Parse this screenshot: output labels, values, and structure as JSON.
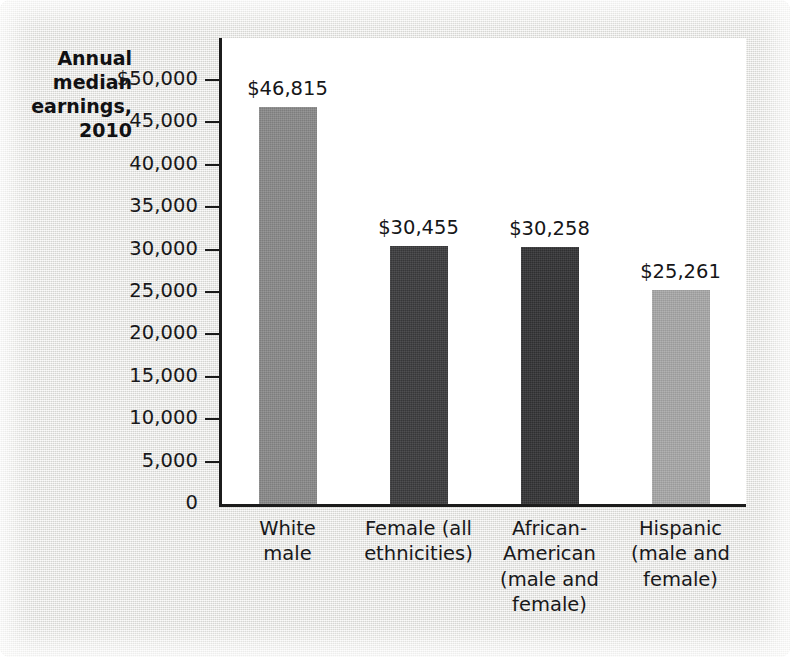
{
  "chart_data": {
    "type": "bar",
    "title": "",
    "ylabel": "Annual median earnings, 2010",
    "ylabel_lines": [
      "Annual",
      "median",
      "earnings,",
      "2010"
    ],
    "xlabel": "",
    "ylim": [
      0,
      50000
    ],
    "grid": false,
    "legend": "none",
    "categories": [
      "White male",
      "Female (all ethnicities)",
      "African-American (male and female)",
      "Hispanic (male and female)"
    ],
    "category_lines": [
      [
        "White",
        "male"
      ],
      [
        "Female (all",
        "ethnicities)"
      ],
      [
        "African-",
        "American",
        "(male and",
        "female)"
      ],
      [
        "Hispanic",
        "(male and",
        "female)"
      ]
    ],
    "values": [
      46815,
      30455,
      30258,
      25261
    ],
    "value_labels": [
      "$46,815",
      "$30,455",
      "$30,258",
      "$25,261"
    ],
    "bar_colors": [
      "#8a8a8a",
      "#3c3c3e",
      "#333335",
      "#a9a9a9"
    ],
    "ytick_values": [
      50000,
      45000,
      40000,
      35000,
      30000,
      25000,
      20000,
      15000,
      10000,
      5000,
      0
    ],
    "ytick_labels": [
      "$50,000",
      "45,000",
      "40,000",
      "35,000",
      "30,000",
      "25,000",
      "20,000",
      "15,000",
      "10,000",
      "5,000",
      "0"
    ]
  },
  "style": {
    "panel_background": "#e9e9e7",
    "plot_background": "#ffffff",
    "axis_color": "#1c1c1c",
    "text_color": "#18181a"
  }
}
